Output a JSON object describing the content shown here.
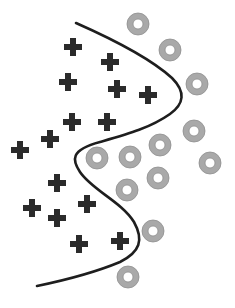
{
  "diagram": {
    "type": "classification-decision-boundary",
    "width": 235,
    "height": 308,
    "colors": {
      "background": "#ffffff",
      "plus": "#2b2b2b",
      "circle_fill": "#a9a9a9",
      "circle_stroke": "#8e8e8e",
      "circle_hole": "#ffffff",
      "boundary": "#1e1e1e"
    },
    "plus_size": 18,
    "plus_thickness": 6,
    "circle_outer_radius": 11,
    "circle_inner_radius": 5,
    "boundary_path": "M76,23 C110,38 150,58 172,78 C186,92 184,104 170,114 C150,128 128,134 100,142 C70,150 72,160 80,172 C92,190 122,202 134,222 C144,240 140,252 120,262 C96,272 66,280 37,286",
    "class_plus": {
      "label": "plus",
      "points": [
        {
          "x": 73,
          "y": 47
        },
        {
          "x": 110,
          "y": 62
        },
        {
          "x": 68,
          "y": 82
        },
        {
          "x": 117,
          "y": 89
        },
        {
          "x": 148,
          "y": 95
        },
        {
          "x": 72,
          "y": 122
        },
        {
          "x": 107,
          "y": 122
        },
        {
          "x": 50,
          "y": 139
        },
        {
          "x": 20,
          "y": 150
        },
        {
          "x": 57,
          "y": 183
        },
        {
          "x": 32,
          "y": 208
        },
        {
          "x": 87,
          "y": 204
        },
        {
          "x": 57,
          "y": 218
        },
        {
          "x": 79,
          "y": 244
        },
        {
          "x": 120,
          "y": 241
        }
      ]
    },
    "class_circle": {
      "label": "circle",
      "points": [
        {
          "x": 138,
          "y": 24
        },
        {
          "x": 170,
          "y": 50
        },
        {
          "x": 197,
          "y": 84
        },
        {
          "x": 194,
          "y": 131
        },
        {
          "x": 210,
          "y": 163
        },
        {
          "x": 97,
          "y": 158
        },
        {
          "x": 130,
          "y": 157
        },
        {
          "x": 160,
          "y": 145
        },
        {
          "x": 158,
          "y": 178
        },
        {
          "x": 127,
          "y": 190
        },
        {
          "x": 153,
          "y": 231
        },
        {
          "x": 128,
          "y": 277
        }
      ]
    }
  }
}
